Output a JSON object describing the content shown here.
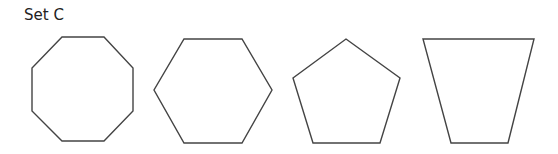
{
  "title": "Set C",
  "colors": {
    "stroke": "#444444",
    "fill": "#ffffff",
    "text": "#222222"
  },
  "shapes": [
    {
      "name": "octagon",
      "sides": 8,
      "points": "62,37 104,37 133,68 133,111 104,141 62,141 32,111 32,68"
    },
    {
      "name": "hexagon",
      "sides": 6,
      "points": "184,39 242,39 272,90 242,143 184,143 154,90"
    },
    {
      "name": "pentagon",
      "sides": 5,
      "points": "346,39 400,78 380,143 313,143 293,78"
    },
    {
      "name": "trapezoid",
      "sides": 4,
      "points": "423,39 534,39 508,143 451,143"
    }
  ]
}
